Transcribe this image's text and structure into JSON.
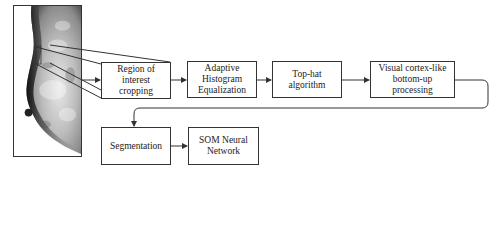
{
  "diagram": {
    "image_panel": {
      "label": "mammogram-image"
    },
    "steps": [
      {
        "id": "roi",
        "label": "Region of interest cropping"
      },
      {
        "id": "ahe",
        "label": "Adaptive Histogram Equalization"
      },
      {
        "id": "tophat",
        "label": "Top-hat algorithm"
      },
      {
        "id": "visual",
        "label": "Visual cortex-like bottom-up processing"
      },
      {
        "id": "seg",
        "label": "Segmentation"
      },
      {
        "id": "som",
        "label": "SOM Neural Network"
      }
    ],
    "flow": [
      "roi",
      "ahe",
      "tophat",
      "visual",
      "seg",
      "som"
    ],
    "colors": {
      "line": "#333333",
      "box_border": "#333333",
      "background": "#ffffff"
    }
  }
}
